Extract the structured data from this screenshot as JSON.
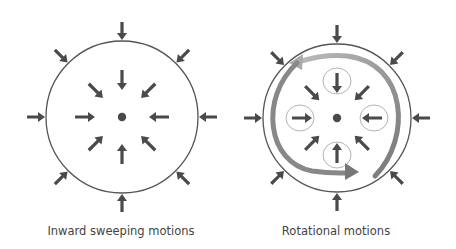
{
  "panels": [
    {
      "id": "inward",
      "caption": "Inward sweeping motions",
      "cx": 122,
      "cy": 117,
      "r": 76,
      "caption_x": 121
    },
    {
      "id": "rotational",
      "caption": "Rotational motions",
      "cx": 337,
      "cy": 118,
      "r": 74,
      "caption_x": 336
    }
  ],
  "colors": {
    "arrow": "#4a4a4a",
    "circle": "#555555",
    "swirl": "#999999",
    "eddy": "#aaaaaa"
  },
  "icons": {
    "arrow": "inward-arrow-icon",
    "dot": "center-dot-icon"
  }
}
